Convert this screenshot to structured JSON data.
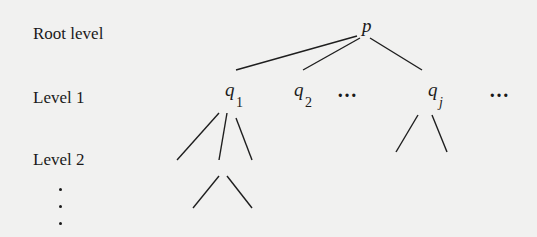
{
  "diagram": {
    "type": "tree",
    "level_labels": [
      "Root level",
      "Level 1",
      "Level 2"
    ],
    "continuation_marker": "vertical ellipsis",
    "root": {
      "symbol": "p"
    },
    "level1_nodes": [
      {
        "symbol": "q",
        "subscript": "1"
      },
      {
        "symbol": "q",
        "subscript": "2"
      },
      {
        "symbol": "q",
        "subscript": "j"
      }
    ],
    "ellipsis_text": "…"
  }
}
